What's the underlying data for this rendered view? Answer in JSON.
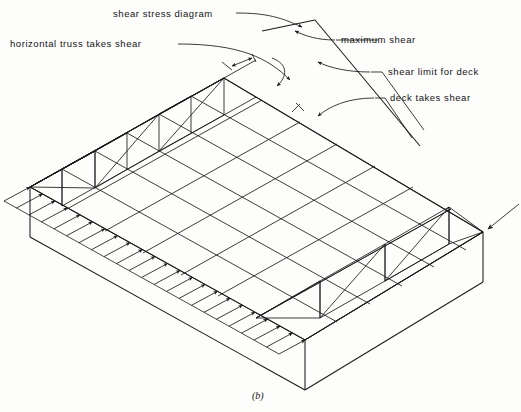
{
  "figure": {
    "caption": "(b)",
    "labels": {
      "shear_stress_diagram": "shear stress diagram",
      "horizontal_truss": "horizontal truss takes shear",
      "maximum_shear": "maximum shear",
      "shear_limit_for_deck": "shear limit for deck",
      "deck_takes_shear": "deck takes shear"
    },
    "colors": {
      "line": "#1a1a1a",
      "background": "#fdfdfc",
      "text": "#141414"
    },
    "geometry": {
      "type": "isometric-deck-diaphragm",
      "deck_top_corners": {
        "left": [
          30,
          187
        ],
        "back": [
          224,
          78
        ],
        "right": [
          483,
          232
        ],
        "front": [
          305,
          340
        ]
      },
      "deck_thickness_px": 50,
      "grid_bays_long": 6,
      "grid_bays_short": 4,
      "load_arrow_count": 23,
      "truss_panels_back": 3,
      "truss_panels_front": 3,
      "shear_diagram": {
        "apex": [
          315,
          20
        ],
        "base_left": [
          262,
          30
        ],
        "base_right": [
          420,
          146
        ]
      }
    }
  }
}
